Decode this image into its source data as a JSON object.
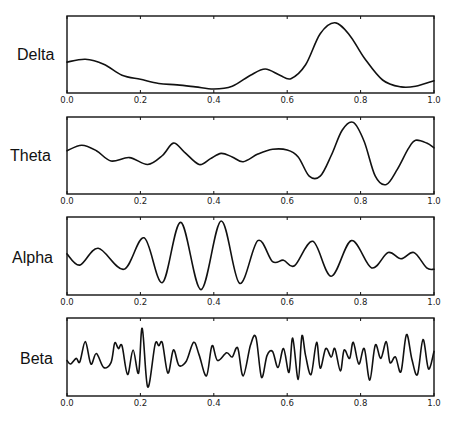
{
  "chart_data": [
    {
      "type": "line",
      "title": "Delta",
      "xlabel": "",
      "ylabel": "Delta",
      "xlim": [
        0.0,
        1.0
      ],
      "xticks": [
        "0.0",
        "0.2",
        "0.4",
        "0.6",
        "0.8",
        "1.0"
      ],
      "grid": false,
      "x": [
        0.0,
        0.05,
        0.1,
        0.15,
        0.2,
        0.25,
        0.3,
        0.35,
        0.4,
        0.45,
        0.5,
        0.54,
        0.58,
        0.61,
        0.65,
        0.69,
        0.73,
        0.77,
        0.81,
        0.86,
        0.91,
        0.95,
        1.0
      ],
      "values": [
        0.39,
        0.43,
        0.36,
        0.2,
        0.14,
        0.08,
        0.06,
        0.03,
        0.0,
        0.04,
        0.2,
        0.29,
        0.2,
        0.15,
        0.35,
        0.8,
        0.96,
        0.78,
        0.45,
        0.13,
        0.03,
        0.04,
        0.12
      ]
    },
    {
      "type": "line",
      "title": "Theta",
      "xlabel": "",
      "ylabel": "Theta",
      "xlim": [
        0.0,
        1.0
      ],
      "xticks": [
        "0.0",
        "0.2",
        "0.4",
        "0.6",
        "0.8",
        "1.0"
      ],
      "grid": false,
      "x": [
        0.0,
        0.04,
        0.08,
        0.12,
        0.17,
        0.22,
        0.26,
        0.29,
        0.32,
        0.36,
        0.39,
        0.42,
        0.45,
        0.48,
        0.52,
        0.56,
        0.6,
        0.63,
        0.66,
        0.69,
        0.72,
        0.75,
        0.78,
        0.81,
        0.84,
        0.87,
        0.9,
        0.93,
        0.95,
        0.98,
        1.0
      ],
      "values": [
        0.57,
        0.65,
        0.57,
        0.42,
        0.47,
        0.37,
        0.5,
        0.68,
        0.55,
        0.37,
        0.45,
        0.53,
        0.48,
        0.41,
        0.52,
        0.59,
        0.58,
        0.48,
        0.2,
        0.2,
        0.5,
        0.87,
        0.98,
        0.7,
        0.2,
        0.08,
        0.3,
        0.6,
        0.72,
        0.68,
        0.61
      ]
    },
    {
      "type": "line",
      "title": "Alpha",
      "xlabel": "",
      "ylabel": "Alpha",
      "xlim": [
        0.0,
        1.0
      ],
      "xticks": [
        "0.0",
        "0.2",
        "0.4",
        "0.6",
        "0.8",
        "1.0"
      ],
      "grid": false,
      "x": [
        0.0,
        0.035,
        0.085,
        0.155,
        0.21,
        0.26,
        0.31,
        0.365,
        0.42,
        0.47,
        0.52,
        0.56,
        0.59,
        0.62,
        0.67,
        0.72,
        0.775,
        0.83,
        0.875,
        0.91,
        0.945,
        0.98,
        1.0
      ],
      "values": [
        0.53,
        0.37,
        0.61,
        0.31,
        0.76,
        0.12,
        0.98,
        0.02,
        1.0,
        0.11,
        0.72,
        0.42,
        0.44,
        0.36,
        0.71,
        0.21,
        0.72,
        0.33,
        0.55,
        0.46,
        0.55,
        0.33,
        0.31
      ]
    },
    {
      "type": "line",
      "title": "Beta",
      "xlabel": "",
      "ylabel": "Beta",
      "xlim": [
        0.0,
        1.0
      ],
      "xticks": [
        "0.0",
        "0.2",
        "0.4",
        "0.6",
        "0.8",
        "1.0"
      ],
      "grid": false,
      "x": [
        0.0,
        0.01,
        0.025,
        0.035,
        0.05,
        0.065,
        0.08,
        0.1,
        0.12,
        0.13,
        0.14,
        0.15,
        0.165,
        0.18,
        0.195,
        0.205,
        0.22,
        0.24,
        0.25,
        0.26,
        0.275,
        0.29,
        0.305,
        0.325,
        0.345,
        0.36,
        0.38,
        0.395,
        0.41,
        0.435,
        0.45,
        0.465,
        0.48,
        0.5,
        0.515,
        0.53,
        0.545,
        0.56,
        0.575,
        0.59,
        0.605,
        0.615,
        0.63,
        0.64,
        0.65,
        0.665,
        0.68,
        0.69,
        0.705,
        0.72,
        0.73,
        0.745,
        0.755,
        0.77,
        0.78,
        0.795,
        0.81,
        0.825,
        0.84,
        0.855,
        0.87,
        0.88,
        0.895,
        0.91,
        0.925,
        0.94,
        0.955,
        0.97,
        0.985,
        1.0
      ],
      "values": [
        0.45,
        0.4,
        0.48,
        0.43,
        0.72,
        0.4,
        0.55,
        0.35,
        0.42,
        0.7,
        0.62,
        0.66,
        0.25,
        0.6,
        0.27,
        0.91,
        0.07,
        0.68,
        0.66,
        0.7,
        0.27,
        0.6,
        0.38,
        0.44,
        0.71,
        0.53,
        0.23,
        0.66,
        0.45,
        0.56,
        0.5,
        0.63,
        0.23,
        0.67,
        0.78,
        0.21,
        0.52,
        0.58,
        0.35,
        0.62,
        0.28,
        0.77,
        0.18,
        0.8,
        0.52,
        0.25,
        0.71,
        0.34,
        0.62,
        0.5,
        0.62,
        0.3,
        0.6,
        0.48,
        0.71,
        0.4,
        0.62,
        0.17,
        0.67,
        0.48,
        0.72,
        0.42,
        0.5,
        0.29,
        0.82,
        0.46,
        0.25,
        0.75,
        0.33,
        0.58
      ]
    }
  ],
  "panels": [
    {
      "label": "Delta"
    },
    {
      "label": "Theta"
    },
    {
      "label": "Alpha"
    },
    {
      "label": "Beta"
    }
  ],
  "axis": {
    "tick_labels": [
      "0.0",
      "0.2",
      "0.4",
      "0.6",
      "0.8",
      "1.0"
    ]
  }
}
